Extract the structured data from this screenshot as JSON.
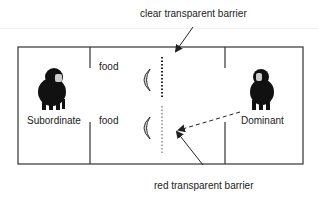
{
  "diagram": {
    "labels": {
      "clear_barrier": "clear transparent barrier",
      "red_barrier": "red transparent barrier",
      "subordinate": "Subordinate",
      "dominant": "Dominant",
      "food_top": "food",
      "food_bottom": "food"
    },
    "icons": {
      "subordinate_animal": "chimpanzee-icon",
      "dominant_animal": "chimpanzee-icon",
      "food_items": "banana-icon"
    },
    "colors": {
      "lines": "#333333",
      "clear_barrier": "#222222",
      "red_barrier": "#aaaaaa",
      "animal": "#111111"
    }
  }
}
